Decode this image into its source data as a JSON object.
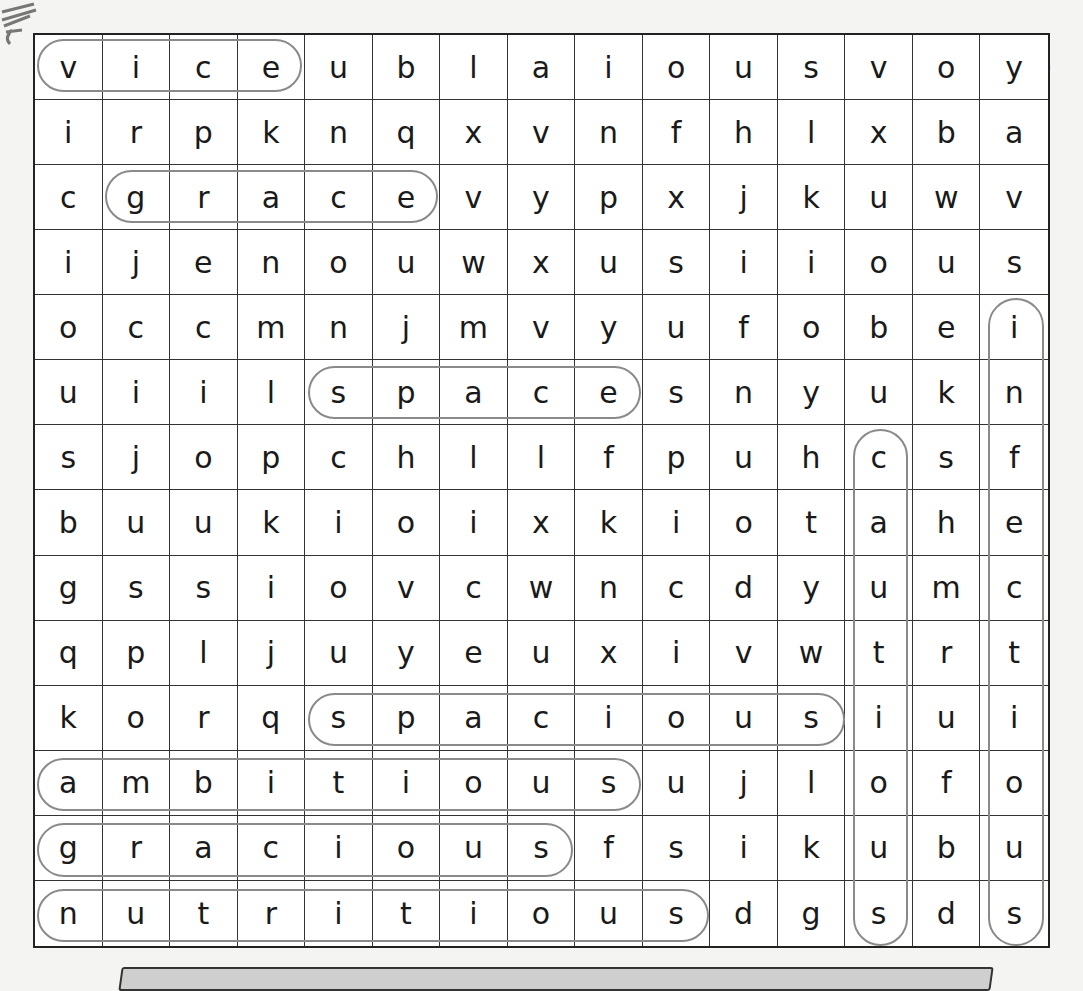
{
  "worksheet": {
    "type": "word-search",
    "columns": 15,
    "rows_count": 14,
    "grid": [
      [
        "v",
        "i",
        "c",
        "e",
        "u",
        "b",
        "l",
        "a",
        "i",
        "o",
        "u",
        "s",
        "v",
        "o",
        "y"
      ],
      [
        "i",
        "r",
        "p",
        "k",
        "n",
        "q",
        "x",
        "v",
        "n",
        "f",
        "h",
        "l",
        "x",
        "b",
        "a"
      ],
      [
        "c",
        "g",
        "r",
        "a",
        "c",
        "e",
        "v",
        "y",
        "p",
        "x",
        "j",
        "k",
        "u",
        "w",
        "v"
      ],
      [
        "i",
        "j",
        "e",
        "n",
        "o",
        "u",
        "w",
        "x",
        "u",
        "s",
        "i",
        "i",
        "o",
        "u",
        "s"
      ],
      [
        "o",
        "c",
        "c",
        "m",
        "n",
        "j",
        "m",
        "v",
        "y",
        "u",
        "f",
        "o",
        "b",
        "e",
        "i"
      ],
      [
        "u",
        "i",
        "i",
        "l",
        "s",
        "p",
        "a",
        "c",
        "e",
        "s",
        "n",
        "y",
        "u",
        "k",
        "n"
      ],
      [
        "s",
        "j",
        "o",
        "p",
        "c",
        "h",
        "l",
        "l",
        "f",
        "p",
        "u",
        "h",
        "c",
        "s",
        "f"
      ],
      [
        "b",
        "u",
        "u",
        "k",
        "i",
        "o",
        "i",
        "x",
        "k",
        "i",
        "o",
        "t",
        "a",
        "h",
        "e"
      ],
      [
        "g",
        "s",
        "s",
        "i",
        "o",
        "v",
        "c",
        "w",
        "n",
        "c",
        "d",
        "y",
        "u",
        "m",
        "c"
      ],
      [
        "q",
        "p",
        "l",
        "j",
        "u",
        "y",
        "e",
        "u",
        "x",
        "i",
        "v",
        "w",
        "t",
        "r",
        "t"
      ],
      [
        "k",
        "o",
        "r",
        "q",
        "s",
        "p",
        "a",
        "c",
        "i",
        "o",
        "u",
        "s",
        "i",
        "u",
        "i"
      ],
      [
        "a",
        "m",
        "b",
        "i",
        "t",
        "i",
        "o",
        "u",
        "s",
        "u",
        "j",
        "l",
        "o",
        "f",
        "o"
      ],
      [
        "g",
        "r",
        "a",
        "c",
        "i",
        "o",
        "u",
        "s",
        "f",
        "s",
        "i",
        "k",
        "u",
        "b",
        "u"
      ],
      [
        "n",
        "u",
        "t",
        "r",
        "i",
        "t",
        "i",
        "o",
        "u",
        "s",
        "d",
        "g",
        "s",
        "d",
        "s"
      ]
    ],
    "found_words": [
      {
        "word": "vice",
        "direction": "horizontal",
        "row": 0,
        "col_start": 0,
        "col_end": 3
      },
      {
        "word": "grace",
        "direction": "horizontal",
        "row": 2,
        "col_start": 1,
        "col_end": 5
      },
      {
        "word": "space",
        "direction": "horizontal",
        "row": 5,
        "col_start": 4,
        "col_end": 8
      },
      {
        "word": "spacious",
        "direction": "horizontal",
        "row": 10,
        "col_start": 4,
        "col_end": 11
      },
      {
        "word": "ambitious",
        "direction": "horizontal",
        "row": 11,
        "col_start": 0,
        "col_end": 8
      },
      {
        "word": "gracious",
        "direction": "horizontal",
        "row": 12,
        "col_start": 0,
        "col_end": 7
      },
      {
        "word": "nutritious",
        "direction": "horizontal",
        "row": 13,
        "col_start": 0,
        "col_end": 9
      },
      {
        "word": "cautious",
        "direction": "vertical",
        "col": 12,
        "row_start": 6,
        "row_end": 13
      },
      {
        "word": "infectious",
        "direction": "vertical",
        "col": 14,
        "row_start": 4,
        "row_end": 13
      }
    ],
    "loop_color": "#8a8a8a"
  }
}
